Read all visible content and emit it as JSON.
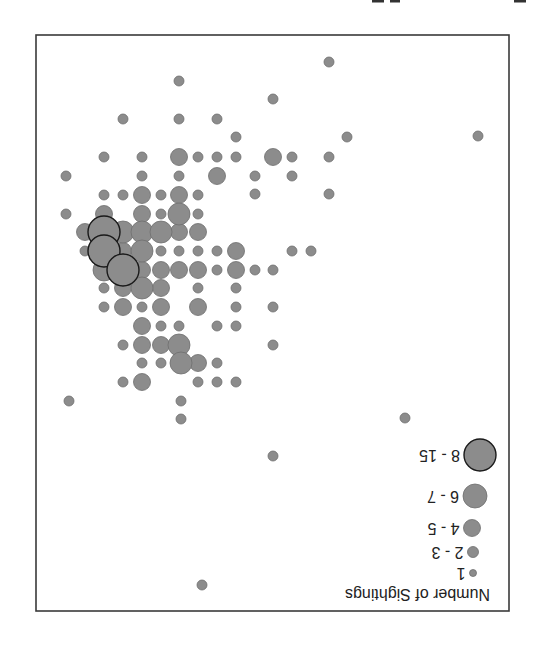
{
  "chart_data": {
    "type": "scatter",
    "title": "",
    "orientation_note": "image is rendered rotated 180 degrees",
    "xlabel": "",
    "ylabel": "",
    "grid": false,
    "legend_position": "inside, bottom-left of chart when upright (appears bottom-right upside-down)",
    "legend": {
      "title": "Number of Sightings",
      "entries": [
        {
          "label": "1",
          "size_class": "s1",
          "radius": 3.5
        },
        {
          "label": "2 - 3",
          "size_class": "s2",
          "radius": 5.5
        },
        {
          "label": "4 - 5",
          "size_class": "s3",
          "radius": 8.5
        },
        {
          "label": "6 - 7",
          "size_class": "s4",
          "radius": 11.5
        },
        {
          "label": "8 - 15",
          "size_class": "s5",
          "radius": 16
        }
      ]
    },
    "size_classes": {
      "s1": {
        "label": "1",
        "radius": 3.5
      },
      "s2": {
        "label": "2 - 3",
        "radius": 5
      },
      "s3": {
        "label": "4 - 5",
        "radius": 8.5
      },
      "s4": {
        "label": "6 - 7",
        "radius": 11
      },
      "s5": {
        "label": "8 - 15",
        "radius": 16
      }
    },
    "points": [
      {
        "x": 329,
        "y": 62,
        "s": "s2"
      },
      {
        "x": 179,
        "y": 81,
        "s": "s2"
      },
      {
        "x": 273,
        "y": 99,
        "s": "s2"
      },
      {
        "x": 123,
        "y": 119,
        "s": "s2"
      },
      {
        "x": 179,
        "y": 119,
        "s": "s2"
      },
      {
        "x": 217,
        "y": 119,
        "s": "s2"
      },
      {
        "x": 236,
        "y": 137,
        "s": "s2"
      },
      {
        "x": 347,
        "y": 137,
        "s": "s2"
      },
      {
        "x": 478,
        "y": 136,
        "s": "s2"
      },
      {
        "x": 104,
        "y": 157,
        "s": "s2"
      },
      {
        "x": 142,
        "y": 157,
        "s": "s2"
      },
      {
        "x": 179,
        "y": 157,
        "s": "s3"
      },
      {
        "x": 198,
        "y": 157,
        "s": "s2"
      },
      {
        "x": 217,
        "y": 157,
        "s": "s2"
      },
      {
        "x": 236,
        "y": 157,
        "s": "s2"
      },
      {
        "x": 273,
        "y": 157,
        "s": "s3"
      },
      {
        "x": 292,
        "y": 157,
        "s": "s2"
      },
      {
        "x": 329,
        "y": 157,
        "s": "s2"
      },
      {
        "x": 66,
        "y": 176,
        "s": "s2"
      },
      {
        "x": 142,
        "y": 176,
        "s": "s2"
      },
      {
        "x": 179,
        "y": 176,
        "s": "s2"
      },
      {
        "x": 217,
        "y": 176,
        "s": "s3"
      },
      {
        "x": 255,
        "y": 176,
        "s": "s2"
      },
      {
        "x": 292,
        "y": 176,
        "s": "s2"
      },
      {
        "x": 104,
        "y": 195,
        "s": "s2"
      },
      {
        "x": 123,
        "y": 195,
        "s": "s2"
      },
      {
        "x": 142,
        "y": 195,
        "s": "s3"
      },
      {
        "x": 161,
        "y": 195,
        "s": "s2"
      },
      {
        "x": 179,
        "y": 195,
        "s": "s3"
      },
      {
        "x": 198,
        "y": 195,
        "s": "s2"
      },
      {
        "x": 255,
        "y": 194,
        "s": "s2"
      },
      {
        "x": 329,
        "y": 194,
        "s": "s2"
      },
      {
        "x": 66,
        "y": 214,
        "s": "s2"
      },
      {
        "x": 104,
        "y": 214,
        "s": "s3"
      },
      {
        "x": 142,
        "y": 214,
        "s": "s3"
      },
      {
        "x": 161,
        "y": 214,
        "s": "s2"
      },
      {
        "x": 179,
        "y": 214,
        "s": "s4"
      },
      {
        "x": 198,
        "y": 214,
        "s": "s2"
      },
      {
        "x": 85,
        "y": 232,
        "s": "s3"
      },
      {
        "x": 123,
        "y": 232,
        "s": "s4"
      },
      {
        "x": 142,
        "y": 232,
        "s": "s4"
      },
      {
        "x": 161,
        "y": 232,
        "s": "s4"
      },
      {
        "x": 179,
        "y": 232,
        "s": "s3"
      },
      {
        "x": 198,
        "y": 232,
        "s": "s3"
      },
      {
        "x": 104,
        "y": 232,
        "s": "s5"
      },
      {
        "x": 85,
        "y": 251,
        "s": "s2"
      },
      {
        "x": 123,
        "y": 251,
        "s": "s3"
      },
      {
        "x": 142,
        "y": 251,
        "s": "s4"
      },
      {
        "x": 161,
        "y": 251,
        "s": "s2"
      },
      {
        "x": 179,
        "y": 251,
        "s": "s2"
      },
      {
        "x": 198,
        "y": 251,
        "s": "s2"
      },
      {
        "x": 217,
        "y": 251,
        "s": "s2"
      },
      {
        "x": 236,
        "y": 251,
        "s": "s3"
      },
      {
        "x": 292,
        "y": 251,
        "s": "s2"
      },
      {
        "x": 311,
        "y": 251,
        "s": "s2"
      },
      {
        "x": 104,
        "y": 251,
        "s": "s5"
      },
      {
        "x": 104,
        "y": 270,
        "s": "s4"
      },
      {
        "x": 142,
        "y": 270,
        "s": "s3"
      },
      {
        "x": 161,
        "y": 270,
        "s": "s3"
      },
      {
        "x": 179,
        "y": 270,
        "s": "s3"
      },
      {
        "x": 198,
        "y": 270,
        "s": "s3"
      },
      {
        "x": 217,
        "y": 270,
        "s": "s2"
      },
      {
        "x": 236,
        "y": 270,
        "s": "s3"
      },
      {
        "x": 255,
        "y": 270,
        "s": "s2"
      },
      {
        "x": 273,
        "y": 270,
        "s": "s2"
      },
      {
        "x": 123,
        "y": 270,
        "s": "s5"
      },
      {
        "x": 104,
        "y": 288,
        "s": "s2"
      },
      {
        "x": 123,
        "y": 288,
        "s": "s3"
      },
      {
        "x": 142,
        "y": 288,
        "s": "s4"
      },
      {
        "x": 161,
        "y": 288,
        "s": "s3"
      },
      {
        "x": 198,
        "y": 288,
        "s": "s2"
      },
      {
        "x": 236,
        "y": 288,
        "s": "s2"
      },
      {
        "x": 104,
        "y": 307,
        "s": "s2"
      },
      {
        "x": 123,
        "y": 307,
        "s": "s3"
      },
      {
        "x": 142,
        "y": 307,
        "s": "s2"
      },
      {
        "x": 161,
        "y": 307,
        "s": "s3"
      },
      {
        "x": 198,
        "y": 307,
        "s": "s3"
      },
      {
        "x": 236,
        "y": 307,
        "s": "s2"
      },
      {
        "x": 273,
        "y": 307,
        "s": "s2"
      },
      {
        "x": 142,
        "y": 326,
        "s": "s3"
      },
      {
        "x": 161,
        "y": 326,
        "s": "s2"
      },
      {
        "x": 179,
        "y": 326,
        "s": "s2"
      },
      {
        "x": 217,
        "y": 326,
        "s": "s2"
      },
      {
        "x": 236,
        "y": 326,
        "s": "s2"
      },
      {
        "x": 123,
        "y": 345,
        "s": "s2"
      },
      {
        "x": 142,
        "y": 345,
        "s": "s3"
      },
      {
        "x": 161,
        "y": 345,
        "s": "s3"
      },
      {
        "x": 179,
        "y": 345,
        "s": "s4"
      },
      {
        "x": 273,
        "y": 345,
        "s": "s2"
      },
      {
        "x": 142,
        "y": 363,
        "s": "s2"
      },
      {
        "x": 161,
        "y": 363,
        "s": "s2"
      },
      {
        "x": 181,
        "y": 363,
        "s": "s4"
      },
      {
        "x": 198,
        "y": 363,
        "s": "s3"
      },
      {
        "x": 217,
        "y": 363,
        "s": "s2"
      },
      {
        "x": 123,
        "y": 382,
        "s": "s2"
      },
      {
        "x": 142,
        "y": 382,
        "s": "s3"
      },
      {
        "x": 198,
        "y": 382,
        "s": "s2"
      },
      {
        "x": 217,
        "y": 382,
        "s": "s2"
      },
      {
        "x": 236,
        "y": 382,
        "s": "s2"
      },
      {
        "x": 69,
        "y": 401,
        "s": "s2"
      },
      {
        "x": 181,
        "y": 401,
        "s": "s2"
      },
      {
        "x": 181,
        "y": 419,
        "s": "s2"
      },
      {
        "x": 405,
        "y": 418,
        "s": "s2"
      },
      {
        "x": 273,
        "y": 456,
        "s": "s2"
      },
      {
        "x": 202,
        "y": 585,
        "s": "s2"
      }
    ]
  },
  "frame": {
    "left": 36,
    "top": 35,
    "right": 509,
    "bottom": 611
  },
  "colors": {
    "point_fill": "#8c8c8c",
    "point_stroke": "#6e6e6e",
    "big_stroke": "#1a1a1a",
    "frame": "#3a3a3a",
    "background": "#ffffff"
  },
  "legend_ui": {
    "title": "Number of Sightings",
    "items": [
      {
        "label": "1",
        "cx": 473,
        "cy": 573,
        "r": 3.5
      },
      {
        "label": "2 - 3",
        "cx": 473,
        "cy": 552,
        "r": 5.5
      },
      {
        "label": "4 - 5",
        "cx": 472,
        "cy": 528,
        "r": 8.5
      },
      {
        "label": "6 - 7",
        "cx": 475,
        "cy": 496,
        "r": 12
      },
      {
        "label": "8 - 15",
        "cx": 480,
        "cy": 455,
        "r": 16
      }
    ]
  }
}
